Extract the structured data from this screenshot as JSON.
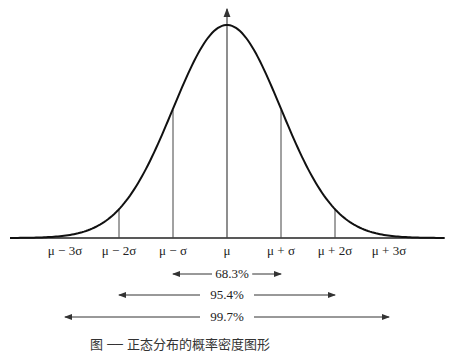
{
  "chart_data": {
    "type": "line",
    "title": "",
    "xlabel": "",
    "ylabel": "",
    "curve": "normal-distribution",
    "tick_labels": [
      "μ − 3σ",
      "μ − 2σ",
      "μ − σ",
      "μ",
      "μ + σ",
      "μ + 2σ",
      "μ + 3σ"
    ],
    "x": [
      -3,
      -2,
      -1,
      0,
      1,
      2,
      3
    ],
    "vertical_lines_at": [
      -2,
      -1,
      0,
      1,
      2
    ],
    "intervals": [
      {
        "range": [
          "μ − σ",
          "μ + σ"
        ],
        "label": "68.3%",
        "value": 68.3
      },
      {
        "range": [
          "μ − 2σ",
          "μ + 2σ"
        ],
        "label": "95.4%",
        "value": 95.4
      },
      {
        "range": [
          "μ − 3σ",
          "μ + 3σ"
        ],
        "label": "99.7%",
        "value": 99.7
      }
    ],
    "grid": false,
    "legend": "none"
  },
  "ticks": [
    "μ − 3σ",
    "μ − 2σ",
    "μ − σ",
    "μ",
    "μ + σ",
    "μ + 2σ",
    "μ + 3σ"
  ],
  "intervals": [
    "68.3%",
    "95.4%",
    "99.7%"
  ],
  "caption": "图 ── 正态分布的概率密度图形"
}
